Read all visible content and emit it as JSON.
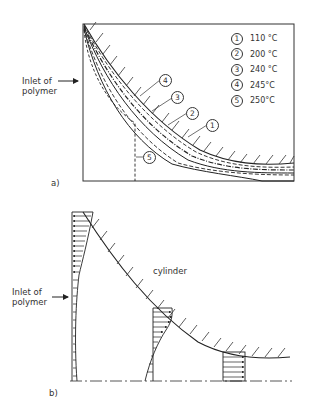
{
  "figure_a": {
    "panel_label": "a)",
    "inlet_label_line1": "Inlet of",
    "inlet_label_line2": "polymer",
    "legend": [
      {
        "num": "1",
        "label": "110 °C"
      },
      {
        "num": "2",
        "label": "200 °C"
      },
      {
        "num": "3",
        "label": "240 °C"
      },
      {
        "num": "4",
        "label": "245°C"
      },
      {
        "num": "5",
        "label": "250°C"
      }
    ],
    "callouts": [
      "4",
      "3",
      "2",
      "1",
      "5"
    ]
  },
  "figure_b": {
    "panel_label": "b)",
    "inlet_label_line1": "Inlet of",
    "inlet_label_line2": "polymer",
    "cylinder_label": "cylinder"
  }
}
